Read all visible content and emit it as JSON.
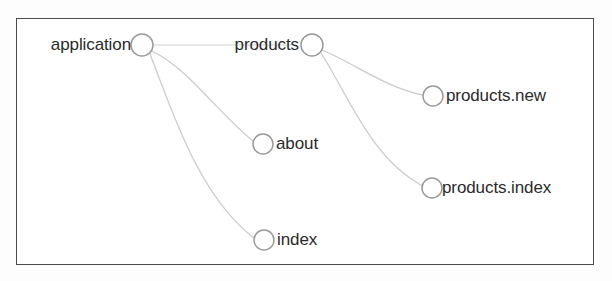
{
  "diagram": {
    "type": "node-graph",
    "title": "",
    "background_color": "#fdfdfd",
    "frame_color": "#4b4b4b",
    "node_stroke_color": "#9a9a9a",
    "edge_color": "#cfcfcf",
    "label_color": "#2b2b2b",
    "nodes": [
      {
        "id": "application",
        "label": "application",
        "cx": 142,
        "cy": 45,
        "r": 11,
        "label_side": "left",
        "label_x": 131,
        "label_y": 45
      },
      {
        "id": "products",
        "label": "products",
        "cx": 312,
        "cy": 45,
        "r": 11,
        "label_side": "left",
        "label_x": 299,
        "label_y": 45
      },
      {
        "id": "products.new",
        "label": "products.new",
        "cx": 433,
        "cy": 96,
        "r": 10,
        "label_side": "right",
        "label_x": 446,
        "label_y": 96
      },
      {
        "id": "about",
        "label": "about",
        "cx": 263,
        "cy": 144,
        "r": 10,
        "label_side": "right",
        "label_x": 276,
        "label_y": 144
      },
      {
        "id": "products.index",
        "label": "products.index",
        "cx": 432,
        "cy": 188,
        "r": 10,
        "label_side": "right",
        "label_x": 442,
        "label_y": 188
      },
      {
        "id": "index",
        "label": "index",
        "cx": 264,
        "cy": 240,
        "r": 10,
        "label_side": "right",
        "label_x": 277,
        "label_y": 240
      }
    ],
    "edges": [
      {
        "from": "application",
        "to": "products",
        "kind": "straight",
        "path": "M 153 45 L 292 45"
      },
      {
        "from": "application",
        "to": "about",
        "kind": "curve",
        "path": "M 152 51 C 190 70 215 110 253 141"
      },
      {
        "from": "application",
        "to": "index",
        "kind": "curve",
        "path": "M 150 54 C 172 110 198 195 254 238"
      },
      {
        "from": "products",
        "to": "products.new",
        "kind": "curve",
        "path": "M 322 50 C 352 62 386 88 423 95"
      },
      {
        "from": "products",
        "to": "products.index",
        "kind": "curve",
        "path": "M 321 53 C 348 95 372 160 423 186"
      }
    ]
  }
}
